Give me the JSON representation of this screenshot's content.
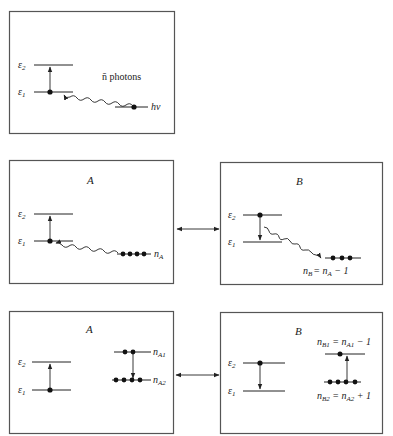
{
  "figure": {
    "panel_top": {
      "levels": [
        "ε",
        "ε"
      ],
      "level_subscripts": [
        "2",
        "1"
      ],
      "photon_label": "n̄ photons",
      "photon_mode_label": "hν"
    },
    "panel_mid_A": {
      "title": "A",
      "levels": [
        "ε",
        "ε"
      ],
      "level_subscripts": [
        "2",
        "1"
      ],
      "photon_count_label": "n",
      "photon_count_subscript": "A",
      "photon_dots": 4
    },
    "panel_mid_B": {
      "title": "B",
      "levels": [
        "ε",
        "ε"
      ],
      "level_subscripts": [
        "2",
        "1"
      ],
      "photon_count_label": "n",
      "photon_count_subscript": "B",
      "photon_count_eq": "= n",
      "photon_count_eq_subscript": "A",
      "photon_count_eq_tail": " − 1",
      "photon_dots": 3
    },
    "panel_bot_A": {
      "title": "A",
      "levels": [
        "ε",
        "ε"
      ],
      "level_subscripts": [
        "2",
        "1"
      ],
      "mode1_label": "n",
      "mode1_subscript": "A1",
      "mode2_label": "n",
      "mode2_subscript": "A2",
      "mode1_dots": 2,
      "mode2_dots": 4
    },
    "panel_bot_B": {
      "title": "B",
      "levels": [
        "ε",
        "ε"
      ],
      "level_subscripts": [
        "2",
        "1"
      ],
      "mode1_label": "n",
      "mode1_subscript": "B1",
      "mode1_eq": " = n",
      "mode1_eq_subscript": "A1",
      "mode1_eq_tail": " − 1",
      "mode2_label": "n",
      "mode2_subscript": "B2",
      "mode2_eq": " = n",
      "mode2_eq_subscript": "A2",
      "mode2_eq_tail": " + 1",
      "mode1_dots": 1,
      "mode2_dots": 4
    }
  }
}
